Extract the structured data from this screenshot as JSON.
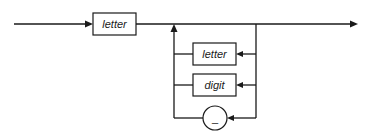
{
  "diagram": {
    "type": "syntax-diagram",
    "main_entry": {
      "label": "letter"
    },
    "loop_options": [
      {
        "label": "letter",
        "shape": "rectangle"
      },
      {
        "label": "digit",
        "shape": "rectangle"
      },
      {
        "label": "_",
        "shape": "circle"
      }
    ],
    "colors": {
      "stroke": "#1a1a1a",
      "background": "#ffffff"
    }
  }
}
